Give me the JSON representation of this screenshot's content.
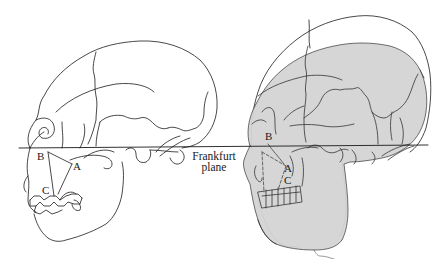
{
  "figure": {
    "colors": {
      "line": "#1a1a1a",
      "shade": "#d4d4d4",
      "background": "#ffffff"
    },
    "left_skull": {
      "labels": {
        "a": "A",
        "b": "B",
        "c": "C"
      }
    },
    "right_skull": {
      "labels": {
        "a": "A",
        "b": "B",
        "c": "C"
      }
    },
    "plane": {
      "line1": "Frankfurt",
      "line2": "plane"
    }
  }
}
